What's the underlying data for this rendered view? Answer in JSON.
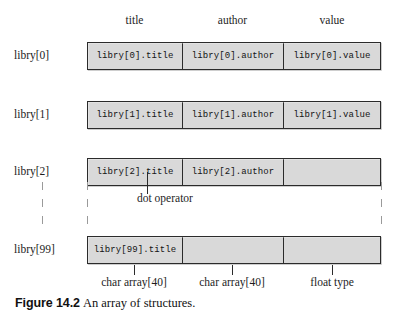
{
  "figure": {
    "caption_number": "Figure 14.2",
    "caption_text": "An array of structures."
  },
  "column_headers": [
    {
      "label": "title"
    },
    {
      "label": "author"
    },
    {
      "label": "value"
    }
  ],
  "rows": [
    {
      "index_label": "libry[0]",
      "cells": [
        {
          "text": "libry[0].title"
        },
        {
          "text": "libry[0].author"
        },
        {
          "text": "libry[0].value"
        }
      ]
    },
    {
      "index_label": "libry[1]",
      "cells": [
        {
          "text": "libry[1].title"
        },
        {
          "text": "libry[1].author"
        },
        {
          "text": "libry[1].value"
        }
      ]
    },
    {
      "index_label": "libry[2]",
      "cells": [
        {
          "text": "libry[2].title"
        },
        {
          "text": "libry[2].author"
        },
        {
          "text": ""
        }
      ]
    },
    {
      "index_label": "libry[99]",
      "cells": [
        {
          "text": "libry[99].title"
        },
        {
          "text": ""
        },
        {
          "text": ""
        }
      ]
    }
  ],
  "annotations": {
    "dot_operator": "dot operator",
    "type_labels": [
      "char array[40]",
      "char array[40]",
      "float type"
    ]
  },
  "colors": {
    "box_fill": "#d9d9d9",
    "box_border": "#2b2b2b",
    "page_background": "#ffffff",
    "text": "#1a1a1a",
    "ellipsis_dash": "#9a9a9a"
  }
}
